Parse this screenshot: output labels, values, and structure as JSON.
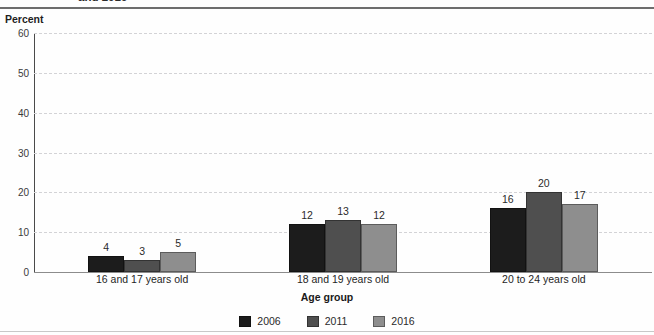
{
  "chart_data": {
    "type": "bar",
    "title": "and 2016",
    "subtitle": "",
    "xlabel": "Age group",
    "ylabel": "Percent",
    "ylim": [
      0,
      60
    ],
    "ytick_step": 10,
    "yticks": [
      "0",
      "10",
      "20",
      "30",
      "40",
      "50",
      "60"
    ],
    "grid": true,
    "legend_position": "bottom",
    "legend_title": "Age group",
    "categories": [
      "16 and 17 years old",
      "18 and 19 years old",
      "20 to 24 years old"
    ],
    "series": [
      {
        "name": "2006",
        "color": "#1c1c1c",
        "values": [
          4,
          12,
          16
        ]
      },
      {
        "name": "2011",
        "color": "#4f4f4f",
        "values": [
          3,
          13,
          20
        ]
      },
      {
        "name": "2016",
        "color": "#8e8e8e",
        "values": [
          5,
          12,
          17
        ]
      }
    ]
  },
  "axis": {
    "y_caption": "Percent"
  },
  "colors": {
    "series_2006": "#1c1c1c",
    "series_2011": "#4f4f4f",
    "series_2016": "#8e8e8e",
    "gridline": "#d3d3d6",
    "axis": "#4a4a4a",
    "background": "#fefefe"
  }
}
